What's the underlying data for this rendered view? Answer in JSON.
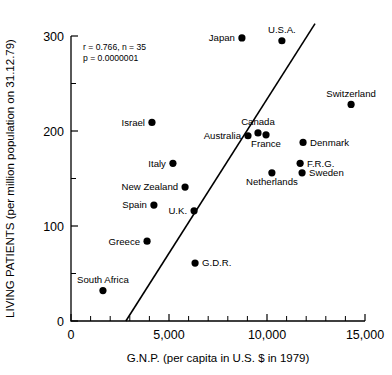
{
  "chart_data": {
    "type": "scatter",
    "title": "",
    "xlabel": "G.N.P. (per capita in U.S. $ in 1979)",
    "ylabel": "LIVING PATIENTS (per million population on 31.12.79)",
    "xlim": [
      0,
      15000
    ],
    "ylim": [
      0,
      300
    ],
    "grid": false,
    "legend": "none",
    "xticks": [
      0,
      5000,
      10000,
      15000
    ],
    "xticklabels": [
      "0",
      "5,000",
      "10,000",
      "15,000"
    ],
    "x_minor_ticks": [
      1000,
      2000,
      3000,
      4000,
      6000,
      7000,
      8000,
      9000,
      11000,
      12000,
      13000,
      14000
    ],
    "yticks": [
      0,
      100,
      200,
      300
    ],
    "yticklabels": [
      "0",
      "100",
      "200",
      "300"
    ],
    "y_minor_ticks": [
      50,
      150,
      250
    ],
    "annotations": [
      "r = 0.766, n = 35",
      "p = 0.0000001"
    ],
    "statistics": {
      "r": 0.766,
      "n": 35,
      "p": 1e-07
    },
    "trendline": {
      "type": "linear-regression",
      "x_start": 2800,
      "y_start": 0,
      "x_end": 12450,
      "y_end": 313
    },
    "points": [
      {
        "label": "Japan",
        "x": 8720,
        "y": 298,
        "label_pos": "left"
      },
      {
        "label": "U.S.A.",
        "x": 10760,
        "y": 295,
        "label_pos": "above"
      },
      {
        "label": "Switzerland",
        "x": 14290,
        "y": 228,
        "label_pos": "above"
      },
      {
        "label": "Israel",
        "x": 4130,
        "y": 209,
        "label_pos": "left"
      },
      {
        "label": "Australia",
        "x": 9030,
        "y": 195,
        "label_pos": "left"
      },
      {
        "label": "Canada",
        "x": 9540,
        "y": 198,
        "label_pos": "above"
      },
      {
        "label": "France",
        "x": 9950,
        "y": 196,
        "label_pos": "below"
      },
      {
        "label": "Denmark",
        "x": 11840,
        "y": 188,
        "label_pos": "right"
      },
      {
        "label": "Italy",
        "x": 5200,
        "y": 166,
        "label_pos": "left"
      },
      {
        "label": "F.R.G.",
        "x": 11690,
        "y": 166,
        "label_pos": "right"
      },
      {
        "label": "Sweden",
        "x": 11790,
        "y": 156,
        "label_pos": "right"
      },
      {
        "label": "Netherlands",
        "x": 10250,
        "y": 156,
        "label_pos": "below"
      },
      {
        "label": "New Zealand",
        "x": 5820,
        "y": 141,
        "label_pos": "left"
      },
      {
        "label": "Spain",
        "x": 4230,
        "y": 122,
        "label_pos": "left"
      },
      {
        "label": "U.K.",
        "x": 6280,
        "y": 116,
        "label_pos": "left"
      },
      {
        "label": "Greece",
        "x": 3880,
        "y": 84,
        "label_pos": "left"
      },
      {
        "label": "G.D.R.",
        "x": 6330,
        "y": 61,
        "label_pos": "right"
      },
      {
        "label": "South Africa",
        "x": 1630,
        "y": 32,
        "label_pos": "above"
      }
    ]
  }
}
